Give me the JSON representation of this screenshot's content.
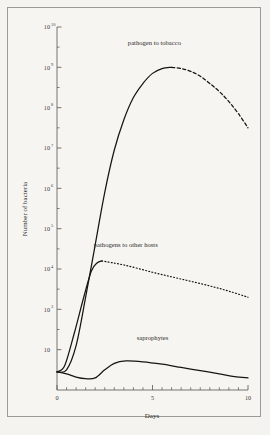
{
  "figure": {
    "background_color": "#f5f3ef",
    "frame_color": "#9a9a96",
    "ink_color": "#16160f"
  },
  "axes": {
    "y_title": "Number of bacteria",
    "x_title": "Days",
    "y_scale": "log",
    "x_scale": "linear",
    "y_tick_labels": [
      "10",
      "10",
      "10",
      "10",
      "10",
      "10",
      "10",
      "10",
      "10"
    ],
    "y_tick_exponents": [
      "10",
      "9",
      "8",
      "7",
      "6",
      "5",
      "4",
      "3",
      ""
    ],
    "y_tick_values": [
      10000000000.0,
      1000000000.0,
      100000000.0,
      10000000.0,
      1000000.0,
      100000.0,
      10000.0,
      1000.0,
      100.0
    ],
    "x_tick_labels": [
      "0",
      "5",
      "10"
    ],
    "x_tick_values": [
      0,
      5,
      10
    ],
    "x_minor_step": 0.5,
    "xlim": [
      0,
      10
    ],
    "ylim_exponent": [
      1,
      10
    ],
    "grid": "off"
  },
  "curve_labels": {
    "pathogen_tobacco": "pathogen to tobacco",
    "pathogens_other": "pathogens to other hosts",
    "saprophytes": "saprophytes"
  },
  "chart_data": {
    "type": "line",
    "title": "",
    "subtitle": "",
    "xlabel": "Days",
    "ylabel": "Number of bacteria",
    "xlim": [
      0,
      10
    ],
    "ylim": [
      10,
      10000000000
    ],
    "yscale": "log",
    "grid": false,
    "legend": "inline annotations",
    "annotations": [
      {
        "text": "pathogen to tobacco",
        "x": 5.1,
        "y_exponent": 9.55
      },
      {
        "text": "pathogens to other hosts",
        "x": 3.6,
        "y_exponent": 4.55
      },
      {
        "text": "saprophytes",
        "x": 5.0,
        "y_exponent": 2.25
      }
    ],
    "series": [
      {
        "name": "pathogen to tobacco",
        "style_solid": "solid",
        "style_extrapolated": "dashed",
        "solid_points": [
          {
            "x": 0.0,
            "y_exponent": 1.45
          },
          {
            "x": 0.5,
            "y_exponent": 1.5
          },
          {
            "x": 1.0,
            "y_exponent": 2.1
          },
          {
            "x": 1.5,
            "y_exponent": 3.3
          },
          {
            "x": 2.0,
            "y_exponent": 4.6
          },
          {
            "x": 2.5,
            "y_exponent": 5.9
          },
          {
            "x": 3.0,
            "y_exponent": 6.95
          },
          {
            "x": 3.5,
            "y_exponent": 7.7
          },
          {
            "x": 4.0,
            "y_exponent": 8.25
          },
          {
            "x": 4.5,
            "y_exponent": 8.6
          },
          {
            "x": 5.0,
            "y_exponent": 8.85
          },
          {
            "x": 5.5,
            "y_exponent": 8.97
          },
          {
            "x": 6.0,
            "y_exponent": 9.0
          }
        ],
        "dashed_points": [
          {
            "x": 6.0,
            "y_exponent": 9.0
          },
          {
            "x": 6.5,
            "y_exponent": 8.97
          },
          {
            "x": 7.0,
            "y_exponent": 8.9
          },
          {
            "x": 7.5,
            "y_exponent": 8.78
          },
          {
            "x": 8.0,
            "y_exponent": 8.6
          },
          {
            "x": 8.5,
            "y_exponent": 8.4
          },
          {
            "x": 9.0,
            "y_exponent": 8.15
          },
          {
            "x": 9.5,
            "y_exponent": 7.85
          },
          {
            "x": 10.0,
            "y_exponent": 7.5
          }
        ]
      },
      {
        "name": "pathogens to other hosts",
        "style_solid": "solid",
        "style_extrapolated": "dotted",
        "solid_points": [
          {
            "x": 0.0,
            "y_exponent": 1.45
          },
          {
            "x": 0.4,
            "y_exponent": 1.6
          },
          {
            "x": 0.9,
            "y_exponent": 2.4
          },
          {
            "x": 1.4,
            "y_exponent": 3.3
          },
          {
            "x": 1.8,
            "y_exponent": 3.95
          },
          {
            "x": 2.1,
            "y_exponent": 4.15
          },
          {
            "x": 2.35,
            "y_exponent": 4.2
          }
        ],
        "dotted_points": [
          {
            "x": 2.35,
            "y_exponent": 4.2
          },
          {
            "x": 3.5,
            "y_exponent": 4.1
          },
          {
            "x": 5.0,
            "y_exponent": 3.92
          },
          {
            "x": 6.5,
            "y_exponent": 3.75
          },
          {
            "x": 8.0,
            "y_exponent": 3.58
          },
          {
            "x": 9.0,
            "y_exponent": 3.45
          },
          {
            "x": 10.0,
            "y_exponent": 3.3
          }
        ]
      },
      {
        "name": "saprophytes",
        "style_solid": "solid",
        "solid_points": [
          {
            "x": 0.0,
            "y_exponent": 1.45
          },
          {
            "x": 0.5,
            "y_exponent": 1.4
          },
          {
            "x": 1.0,
            "y_exponent": 1.32
          },
          {
            "x": 1.5,
            "y_exponent": 1.28
          },
          {
            "x": 2.0,
            "y_exponent": 1.3
          },
          {
            "x": 2.5,
            "y_exponent": 1.5
          },
          {
            "x": 3.0,
            "y_exponent": 1.66
          },
          {
            "x": 3.6,
            "y_exponent": 1.72
          },
          {
            "x": 4.5,
            "y_exponent": 1.7
          },
          {
            "x": 5.5,
            "y_exponent": 1.64
          },
          {
            "x": 6.5,
            "y_exponent": 1.56
          },
          {
            "x": 7.5,
            "y_exponent": 1.48
          },
          {
            "x": 8.5,
            "y_exponent": 1.4
          },
          {
            "x": 9.3,
            "y_exponent": 1.33
          },
          {
            "x": 10.0,
            "y_exponent": 1.3
          }
        ]
      }
    ]
  }
}
